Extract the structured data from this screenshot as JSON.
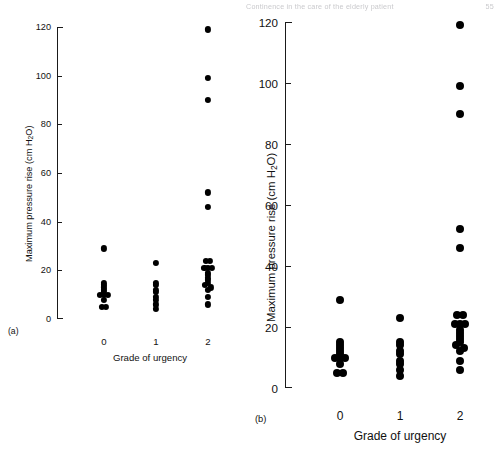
{
  "running_head": {
    "text": "Continence in the care of the elderly patient",
    "page": "55"
  },
  "figure": {
    "panels": [
      {
        "id": "a",
        "letter": "(a)",
        "ylabel": "Maximum pressure rise (cm H",
        "ylabel_sub": "2",
        "ylabel_tail": "O)",
        "xlabel": "Grade of urgency",
        "yticks": [
          0,
          20,
          40,
          60,
          80,
          100,
          120
        ],
        "xticks": [
          "0",
          "1",
          "2"
        ]
      },
      {
        "id": "b",
        "letter": "(b)",
        "ylabel": "Maximum pressure rise (cm H",
        "ylabel_sub": "2",
        "ylabel_tail": "O)",
        "xlabel": "Grade of urgency",
        "yticks": [
          0,
          20,
          40,
          60,
          80,
          100,
          120
        ],
        "xticks": [
          "0",
          "1",
          "2"
        ]
      }
    ]
  },
  "chart_data": {
    "type": "scatter",
    "title": "",
    "xlabel": "Grade of urgency",
    "ylabel": "Maximum pressure rise (cm H2O)",
    "ylim": [
      0,
      120
    ],
    "yticks": [
      0,
      20,
      40,
      60,
      80,
      100,
      120
    ],
    "grid": false,
    "legend": "none",
    "categories": [
      "0",
      "1",
      "2"
    ],
    "note": "Two panels (a) and (b) show the same dataset; (b) is an enlarged rendering of (a).",
    "groups": [
      {
        "category": "0",
        "n": 12,
        "values": [
          29,
          15,
          14,
          13,
          12,
          11,
          10,
          10,
          10,
          8,
          5,
          5
        ],
        "jitter": [
          0,
          0,
          0,
          0,
          0,
          0,
          -1,
          0,
          1,
          0,
          -0.55,
          0.55
        ]
      },
      {
        "category": "1",
        "n": 9,
        "values": [
          23,
          15,
          14,
          12,
          11,
          9,
          8,
          6,
          4
        ],
        "jitter": [
          0,
          0,
          0,
          0,
          0,
          0,
          0,
          0,
          0
        ]
      },
      {
        "category": "2",
        "n": 20,
        "values": [
          119,
          99,
          90,
          52,
          46,
          24,
          24,
          21,
          21,
          21,
          19,
          18,
          17,
          16,
          15,
          14,
          13,
          12,
          9,
          6
        ],
        "jitter": [
          0,
          0,
          0,
          0,
          0,
          -0.5,
          0.5,
          -0.9,
          0,
          0.9,
          0,
          0,
          0,
          0,
          0,
          -0.7,
          0.7,
          0,
          0,
          0
        ]
      }
    ]
  }
}
